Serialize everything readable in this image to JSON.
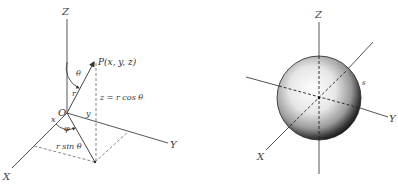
{
  "figure_left": {
    "title": "Spherical coordinates of point P",
    "axes": {
      "z_label": "Z",
      "x_label": "X",
      "y_label": "Y"
    },
    "origin_label": "O",
    "point_label": "P(x, y, z)",
    "angle_theta": "θ",
    "angle_phi": "φ",
    "radius_label": "r",
    "z_relation": "z = r cos θ",
    "projection_label": "r sin θ",
    "x_component": "x",
    "y_component": "y"
  },
  "figure_right": {
    "title": "Sphere centered at origin",
    "axes": {
      "z_label": "Z",
      "x_label": "X",
      "y_label": "Y"
    },
    "surface_label": "s"
  },
  "colors": {
    "line": "#555555",
    "dashed": "#777777",
    "text": "#333333",
    "sphere_light": "#ffffff",
    "sphere_dark": "#222222"
  }
}
